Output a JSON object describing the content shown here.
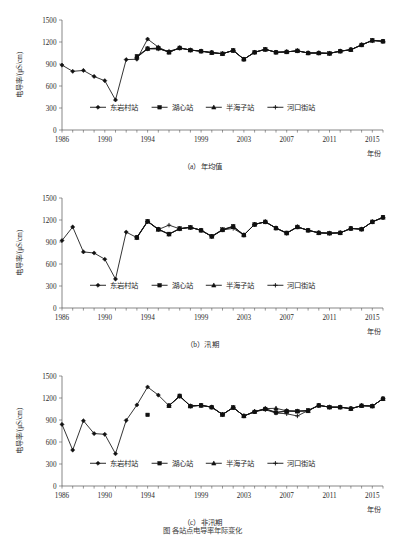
{
  "figure": {
    "bottom_caption": "图  各站点电导率年际变化"
  },
  "axis": {
    "y_label": "电导率/(μS/cm)",
    "x_label": "年份",
    "y_ticks": [
      0,
      300,
      600,
      900,
      1200,
      1500
    ],
    "x_ticks": [
      1986,
      1990,
      1994,
      1999,
      2003,
      2007,
      2011,
      2015
    ],
    "x_min": 1986,
    "x_max": 2016,
    "y_min": 0,
    "y_max": 1500
  },
  "legend": {
    "items": [
      {
        "label": "东岩村站",
        "marker": "diamond"
      },
      {
        "label": "湖心站",
        "marker": "square"
      },
      {
        "label": "半海子站",
        "marker": "triangle"
      },
      {
        "label": "河口街站",
        "marker": "cross"
      }
    ]
  },
  "panels": [
    {
      "id": "a",
      "caption": "（a）年均值"
    },
    {
      "id": "b",
      "caption": "（b）汛期"
    },
    {
      "id": "c",
      "caption": "（c）非汛期"
    }
  ],
  "chart_data": [
    {
      "type": "line",
      "title": "（a）年均值",
      "xlabel": "年份",
      "ylabel": "电导率/(μS/cm)",
      "xlim": [
        1986,
        2016
      ],
      "ylim": [
        0,
        1500
      ],
      "grid": false,
      "legend_position": "inside-bottom",
      "x": [
        1986,
        1987,
        1988,
        1989,
        1990,
        1991,
        1992,
        1993,
        1994,
        1995,
        1996,
        1997,
        1998,
        1999,
        2000,
        2001,
        2002,
        2003,
        2004,
        2005,
        2006,
        2007,
        2008,
        2009,
        2010,
        2011,
        2012,
        2013,
        2014,
        2015,
        2016
      ],
      "series": [
        {
          "name": "东岩村站",
          "marker": "diamond",
          "values": [
            885,
            800,
            812,
            730,
            672,
            410,
            960,
            965,
            1240,
            1130,
            1060,
            1120,
            1090,
            1075,
            1055,
            1040,
            1085,
            965,
            1060,
            1100,
            1060,
            1065,
            1080,
            1050,
            1050,
            1045,
            1075,
            1095,
            1160,
            1220,
            1210
          ]
        },
        {
          "name": "湖心站",
          "marker": "square",
          "values": [
            null,
            null,
            null,
            null,
            null,
            null,
            null,
            1005,
            1110,
            1115,
            1060,
            1120,
            1090,
            1075,
            1055,
            1040,
            1085,
            965,
            1060,
            1100,
            1060,
            1065,
            1080,
            1050,
            1050,
            1045,
            1075,
            1095,
            1160,
            1225,
            1210
          ]
        },
        {
          "name": "半海子站",
          "marker": "triangle",
          "values": [
            null,
            null,
            null,
            null,
            null,
            null,
            null,
            1000,
            1110,
            1115,
            1060,
            1120,
            1090,
            1075,
            1055,
            1040,
            1085,
            965,
            1060,
            1100,
            1060,
            1065,
            1080,
            1050,
            1050,
            1045,
            1075,
            1095,
            1160,
            1220,
            1210
          ]
        },
        {
          "name": "河口街站",
          "marker": "cross",
          "values": [
            null,
            null,
            null,
            null,
            null,
            null,
            null,
            990,
            1105,
            1105,
            1075,
            1115,
            1090,
            1075,
            1055,
            1040,
            1085,
            965,
            1060,
            1100,
            1060,
            1065,
            1080,
            1050,
            1050,
            1045,
            1075,
            1095,
            1160,
            1220,
            1210
          ]
        }
      ]
    },
    {
      "type": "line",
      "title": "（b）汛期",
      "xlabel": "年份",
      "ylabel": "电导率/(μS/cm)",
      "xlim": [
        1986,
        2016
      ],
      "ylim": [
        0,
        1500
      ],
      "grid": false,
      "legend_position": "inside-bottom",
      "x": [
        1986,
        1987,
        1988,
        1989,
        1990,
        1991,
        1992,
        1993,
        1994,
        1995,
        1996,
        1997,
        1998,
        1999,
        2000,
        2001,
        2002,
        2003,
        2004,
        2005,
        2006,
        2007,
        2008,
        2009,
        2010,
        2011,
        2012,
        2013,
        2014,
        2015,
        2016
      ],
      "series": [
        {
          "name": "东岩村站",
          "marker": "diamond",
          "values": [
            920,
            1105,
            765,
            750,
            665,
            395,
            1035,
            960,
            1180,
            1075,
            1005,
            1080,
            1100,
            1060,
            975,
            1065,
            1110,
            995,
            1140,
            1175,
            1090,
            1020,
            1105,
            1060,
            1025,
            1020,
            1025,
            1085,
            1075,
            1175,
            1235,
            1195
          ]
        },
        {
          "name": "湖心站",
          "marker": "square",
          "values": [
            null,
            null,
            null,
            null,
            null,
            null,
            null,
            965,
            1185,
            1075,
            1010,
            1085,
            1100,
            1060,
            980,
            1070,
            1115,
            995,
            1140,
            1175,
            1090,
            1025,
            1105,
            1060,
            1025,
            1020,
            1025,
            1085,
            1075,
            1175,
            1240,
            1195
          ]
        },
        {
          "name": "半海子站",
          "marker": "triangle",
          "values": [
            null,
            null,
            null,
            null,
            null,
            null,
            null,
            960,
            1180,
            1070,
            1005,
            1080,
            1100,
            1060,
            975,
            1065,
            1110,
            995,
            1140,
            1175,
            1090,
            1020,
            1105,
            1060,
            1025,
            1020,
            1025,
            1085,
            1075,
            1175,
            1235,
            1195
          ]
        },
        {
          "name": "河口街站",
          "marker": "cross",
          "values": [
            null,
            null,
            null,
            null,
            null,
            null,
            null,
            960,
            1180,
            1070,
            1130,
            1080,
            1100,
            1060,
            975,
            1065,
            1085,
            995,
            1140,
            1175,
            1090,
            1020,
            1105,
            1060,
            1025,
            1020,
            1025,
            1085,
            1075,
            1175,
            1230,
            1195
          ]
        }
      ]
    },
    {
      "type": "line",
      "title": "（c）非汛期",
      "xlabel": "年份",
      "ylabel": "电导率/(μS/cm)",
      "xlim": [
        1986,
        2016
      ],
      "ylim": [
        0,
        1500
      ],
      "grid": false,
      "legend_position": "inside-bottom",
      "x": [
        1986,
        1987,
        1988,
        1989,
        1990,
        1991,
        1992,
        1993,
        1994,
        1995,
        1996,
        1997,
        1998,
        1999,
        2000,
        2001,
        2002,
        2003,
        2004,
        2005,
        2006,
        2007,
        2008,
        2009,
        2010,
        2011,
        2012,
        2013,
        2014,
        2015,
        2016
      ],
      "series": [
        {
          "name": "东岩村站",
          "marker": "diamond",
          "values": [
            840,
            490,
            890,
            715,
            705,
            440,
            895,
            1105,
            1350,
            1240,
            1095,
            1225,
            1090,
            1100,
            1075,
            975,
            1070,
            955,
            1015,
            1055,
            1005,
            1025,
            1020,
            1025,
            1100,
            1075,
            1075,
            1055,
            1095,
            1090,
            1190,
            1215,
            1240
          ]
        },
        {
          "name": "湖心站",
          "marker": "square",
          "values": [
            null,
            null,
            null,
            null,
            null,
            null,
            null,
            null,
            970,
            null,
            1095,
            1230,
            1090,
            1100,
            1075,
            975,
            1070,
            955,
            1010,
            1050,
            1000,
            1020,
            1020,
            1030,
            1100,
            1075,
            1075,
            1055,
            1095,
            1090,
            1190,
            1210,
            1235
          ]
        },
        {
          "name": "半海子站",
          "marker": "triangle",
          "values": [
            null,
            null,
            null,
            null,
            null,
            null,
            null,
            null,
            null,
            null,
            1095,
            1225,
            1090,
            1100,
            1075,
            975,
            1070,
            955,
            1015,
            1055,
            1060,
            1025,
            1020,
            1025,
            1100,
            1075,
            1075,
            1055,
            1095,
            1090,
            1190,
            1215,
            1240
          ]
        },
        {
          "name": "河口街站",
          "marker": "cross",
          "values": [
            null,
            null,
            null,
            null,
            null,
            null,
            null,
            null,
            null,
            null,
            1095,
            1225,
            1090,
            1100,
            1075,
            975,
            1070,
            955,
            1015,
            1040,
            995,
            985,
            955,
            1030,
            1100,
            1075,
            1075,
            1055,
            1095,
            1090,
            1190,
            1215,
            1240
          ]
        }
      ]
    }
  ]
}
